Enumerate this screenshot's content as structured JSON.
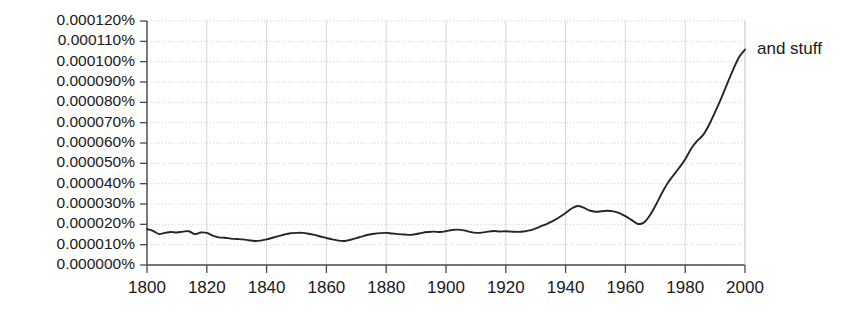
{
  "chart_data": {
    "type": "line",
    "title": "",
    "subtitle": "",
    "xlabel": "",
    "ylabel": "",
    "xlim": [
      1800,
      2000
    ],
    "ylim": [
      0.0,
      0.00012
    ],
    "grid": true,
    "legend_position": "right-inline",
    "y_tick_labels": [
      "0.000120%",
      "0.000110%",
      "0.000100%",
      "0.000090%",
      "0.000080%",
      "0.000070%",
      "0.000060%",
      "0.000050%",
      "0.000040%",
      "0.000030%",
      "0.000020%",
      "0.000010%",
      "0.000000%"
    ],
    "y_tick_values": [
      0.00012,
      0.00011,
      0.0001,
      9e-05,
      8e-05,
      7e-05,
      6e-05,
      5e-05,
      4e-05,
      3e-05,
      2e-05,
      1e-05,
      0.0
    ],
    "x_tick_labels": [
      "1800",
      "1820",
      "1840",
      "1860",
      "1880",
      "1900",
      "1920",
      "1940",
      "1960",
      "1980",
      "2000"
    ],
    "x_tick_values": [
      1800,
      1820,
      1840,
      1860,
      1880,
      1900,
      1920,
      1940,
      1960,
      1980,
      2000
    ],
    "annotations": [
      {
        "text": "and stuff",
        "x": 2000,
        "y": 0.000106,
        "placement": "right"
      }
    ],
    "series": [
      {
        "name": "and stuff",
        "color": "#262626",
        "x": [
          1800,
          1802,
          1804,
          1806,
          1808,
          1810,
          1812,
          1814,
          1816,
          1818,
          1820,
          1822,
          1824,
          1826,
          1828,
          1830,
          1832,
          1834,
          1836,
          1838,
          1840,
          1842,
          1844,
          1846,
          1848,
          1850,
          1852,
          1854,
          1856,
          1858,
          1860,
          1862,
          1864,
          1866,
          1868,
          1870,
          1872,
          1874,
          1876,
          1878,
          1880,
          1882,
          1884,
          1886,
          1888,
          1890,
          1892,
          1894,
          1896,
          1898,
          1900,
          1902,
          1904,
          1906,
          1908,
          1910,
          1912,
          1914,
          1916,
          1918,
          1920,
          1922,
          1924,
          1926,
          1928,
          1930,
          1932,
          1934,
          1936,
          1938,
          1940,
          1942,
          1944,
          1946,
          1948,
          1950,
          1952,
          1954,
          1956,
          1958,
          1960,
          1962,
          1964,
          1966,
          1968,
          1970,
          1972,
          1974,
          1976,
          1978,
          1980,
          1982,
          1984,
          1986,
          1988,
          1990,
          1992,
          1994,
          1996,
          1998,
          2000
        ],
        "y": [
          1.77e-05,
          1.68e-05,
          1.52e-05,
          1.58e-05,
          1.62e-05,
          1.6e-05,
          1.64e-05,
          1.66e-05,
          1.52e-05,
          1.6e-05,
          1.58e-05,
          1.44e-05,
          1.36e-05,
          1.34e-05,
          1.3e-05,
          1.28e-05,
          1.26e-05,
          1.22e-05,
          1.18e-05,
          1.2e-05,
          1.26e-05,
          1.34e-05,
          1.42e-05,
          1.5e-05,
          1.56e-05,
          1.58e-05,
          1.58e-05,
          1.54e-05,
          1.48e-05,
          1.4e-05,
          1.33e-05,
          1.26e-05,
          1.2e-05,
          1.18e-05,
          1.24e-05,
          1.32e-05,
          1.41e-05,
          1.49e-05,
          1.54e-05,
          1.57e-05,
          1.58e-05,
          1.55e-05,
          1.52e-05,
          1.5e-05,
          1.48e-05,
          1.52e-05,
          1.58e-05,
          1.62e-05,
          1.64e-05,
          1.62e-05,
          1.66e-05,
          1.72e-05,
          1.74e-05,
          1.7e-05,
          1.63e-05,
          1.58e-05,
          1.59e-05,
          1.64e-05,
          1.67e-05,
          1.65e-05,
          1.66e-05,
          1.64e-05,
          1.63e-05,
          1.65e-05,
          1.7e-05,
          1.8e-05,
          1.92e-05,
          2.04e-05,
          2.18e-05,
          2.36e-05,
          2.56e-05,
          2.78e-05,
          2.9e-05,
          2.82e-05,
          2.68e-05,
          2.62e-05,
          2.64e-05,
          2.67e-05,
          2.64e-05,
          2.55e-05,
          2.4e-05,
          2.22e-05,
          2.03e-05,
          2.07e-05,
          2.4e-05,
          2.9e-05,
          3.48e-05,
          4e-05,
          4.4e-05,
          4.78e-05,
          5.2e-05,
          5.72e-05,
          6.1e-05,
          6.4e-05,
          6.9e-05,
          7.52e-05,
          8.18e-05,
          8.9e-05,
          9.6e-05,
          0.0001022,
          0.000106
        ]
      }
    ]
  },
  "plot_geometry": {
    "left": 147,
    "right": 745,
    "top": 21,
    "bottom": 265
  }
}
